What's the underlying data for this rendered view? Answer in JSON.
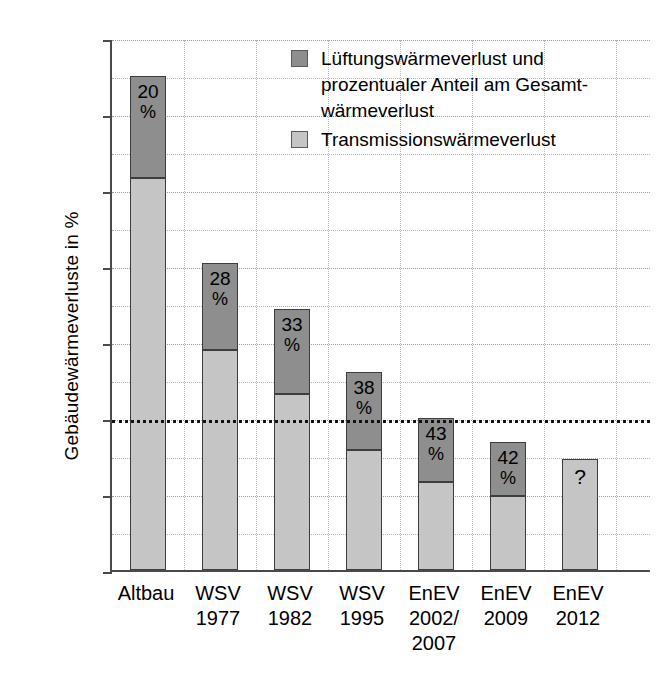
{
  "chart_data": {
    "type": "bar",
    "subtype": "stacked",
    "title": "",
    "xlabel": "",
    "ylabel": "Gebäudewärmeverluste in %",
    "yunit": "%",
    "ylim": [
      0,
      350
    ],
    "yticks": [
      0,
      50,
      100,
      150,
      200,
      250,
      300,
      350
    ],
    "ytick_labels": [
      "0",
      "50",
      "100",
      "150",
      "200",
      "250",
      "300",
      "350"
    ],
    "grid": true,
    "grid_minor_step": 25,
    "reference_line": {
      "value": 100,
      "style": "dotted",
      "label": ""
    },
    "legend_position": "top-right",
    "categories": [
      "Altbau",
      "WSV 1977",
      "WSV 1982",
      "WSV 1995",
      "EnEV 2002/ 2007",
      "EnEV 2009",
      "EnEV 2012"
    ],
    "series": [
      {
        "name": "Transmissionswärmeverlust",
        "color": "#c5c5c5",
        "values": [
          258,
          145,
          116,
          79,
          58,
          49,
          73
        ]
      },
      {
        "name": "Lüftungswärmeverlust und prozentualer Anteil am Gesamtwärmeverlust",
        "color": "#8e8e8e",
        "values": [
          67,
          57,
          56,
          51,
          42,
          35,
          0
        ]
      }
    ],
    "totals": [
      325,
      202,
      172,
      130,
      100,
      84,
      73
    ],
    "data_labels": [
      "20 %",
      "28 %",
      "33 %",
      "38 %",
      "43 %",
      "42 %",
      "?"
    ]
  },
  "axis": {
    "y_title": "Gebäudewärmeverluste in %",
    "y_unit_label": "%",
    "y_ticks": [
      {
        "value": 350,
        "label": "350"
      },
      {
        "value": 300,
        "label": "300"
      },
      {
        "value": 250,
        "label": "250"
      },
      {
        "value": 200,
        "label": "200"
      },
      {
        "value": 150,
        "label": "150"
      },
      {
        "value": 100,
        "label": "100"
      },
      {
        "value": 50,
        "label": "50"
      },
      {
        "value": 0,
        "label": "0"
      }
    ]
  },
  "legend": {
    "items": [
      {
        "swatch": "dark",
        "color": "#8e8e8e",
        "text": "Lüftungswärmeverlust und\nprozentualer Anteil am Gesamt-\nwärmeverlust"
      },
      {
        "swatch": "light",
        "color": "#c5c5c5",
        "text": "Transmissionswärmeverlust"
      }
    ]
  },
  "bars": [
    {
      "category_line1": "Altbau",
      "category_line2": "",
      "total": 325,
      "light_value": 258,
      "dark_value": 67,
      "label_num": "20",
      "label_sign": "%",
      "has_dark": true
    },
    {
      "category_line1": "WSV",
      "category_line2": "1977",
      "total": 202,
      "light_value": 145,
      "dark_value": 57,
      "label_num": "28",
      "label_sign": "%",
      "has_dark": true
    },
    {
      "category_line1": "WSV",
      "category_line2": "1982",
      "total": 172,
      "light_value": 116,
      "dark_value": 56,
      "label_num": "33",
      "label_sign": "%",
      "has_dark": true
    },
    {
      "category_line1": "WSV",
      "category_line2": "1995",
      "total": 130,
      "light_value": 79,
      "dark_value": 51,
      "label_num": "38",
      "label_sign": "%",
      "has_dark": true
    },
    {
      "category_line1": "EnEV",
      "category_line2": "2002/",
      "category_line3": "2007",
      "total": 100,
      "light_value": 58,
      "dark_value": 42,
      "label_num": "43",
      "label_sign": "%",
      "has_dark": true
    },
    {
      "category_line1": "EnEV",
      "category_line2": "2009",
      "total": 84,
      "light_value": 49,
      "dark_value": 35,
      "label_num": "42",
      "label_sign": "%",
      "has_dark": true
    },
    {
      "category_line1": "EnEV",
      "category_line2": "2012",
      "total": 73,
      "light_value": 73,
      "dark_value": 0,
      "label_num": "?",
      "label_sign": "",
      "has_dark": false
    }
  ]
}
